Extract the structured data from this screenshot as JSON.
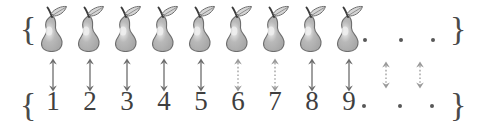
{
  "figure": {
    "type": "bijection-diagram",
    "colors": {
      "background": "#ffffff",
      "ink": "#4a4a4a",
      "pear_body": "#b9b9b9",
      "pear_outline": "#6e6e6e",
      "pear_highlight": "#efefef",
      "leaf_fill": "#d6d6d6",
      "stem": "#3a3a3a",
      "arrow_solid": "#6d6d6d",
      "arrow_dotted": "#9a9a9a",
      "dot": "#585858"
    },
    "braces": {
      "open": "{",
      "close": "}"
    },
    "top_set": {
      "name": "set-of-pears",
      "item_label": "pear",
      "item_count": 9,
      "items": [
        "pear",
        "pear",
        "pear",
        "pear",
        "pear",
        "pear",
        "pear",
        "pear",
        "pear"
      ],
      "ellipsis": ".  .  ."
    },
    "bottom_set": {
      "name": "set-of-natural-numbers",
      "count": 9,
      "numbers": [
        "1",
        "2",
        "3",
        "4",
        "5",
        "6",
        "7",
        "8",
        "9"
      ],
      "ellipsis": ".  .  ."
    },
    "arrows": {
      "style_label": "double-headed",
      "solid_count": 9,
      "dotted_count": 2,
      "items": [
        {
          "index": 1,
          "style": "solid"
        },
        {
          "index": 2,
          "style": "solid"
        },
        {
          "index": 3,
          "style": "solid"
        },
        {
          "index": 4,
          "style": "solid"
        },
        {
          "index": 5,
          "style": "solid"
        },
        {
          "index": 6,
          "style": "dotted"
        },
        {
          "index": 7,
          "style": "dotted"
        },
        {
          "index": 8,
          "style": "solid"
        },
        {
          "index": 9,
          "style": "solid"
        },
        {
          "index": 10,
          "style": "dotted"
        },
        {
          "index": 11,
          "style": "dotted"
        }
      ]
    },
    "layout": {
      "pear_x": [
        36,
        73,
        110,
        147,
        184,
        221,
        258,
        295,
        332
      ],
      "number_x": [
        40,
        77,
        114,
        151,
        188,
        225,
        262,
        299,
        336
      ],
      "arrow_x": [
        44,
        81,
        118,
        155,
        192,
        229,
        266,
        303,
        340,
        377,
        411
      ],
      "arrow_long_top": 58,
      "arrow_long_height": 34,
      "arrow_short_top": 61,
      "arrow_short_height": 28,
      "top_dot_x": [
        363,
        399,
        431
      ],
      "bottom_dot_x": [
        362,
        398,
        430
      ]
    }
  }
}
